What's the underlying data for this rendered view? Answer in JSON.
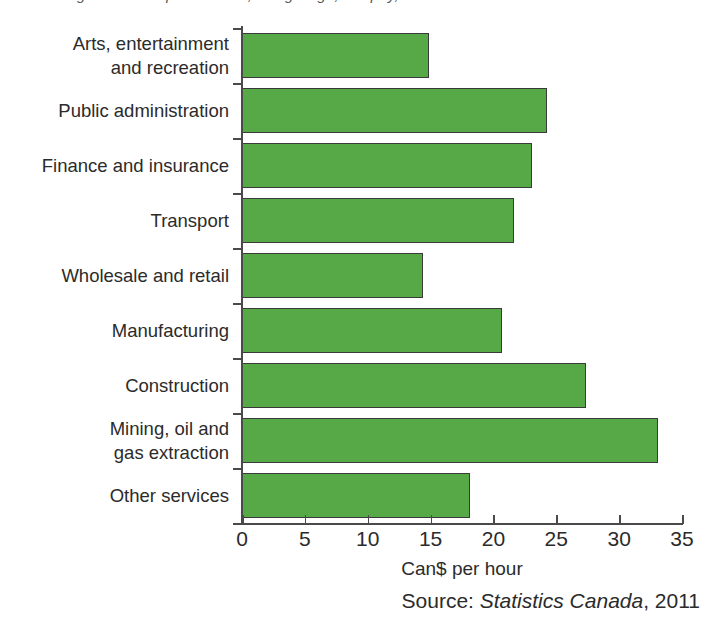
{
  "clipped_title": "degrees of competitiveness, rising wage, low pay,",
  "chart_data": {
    "type": "bar",
    "orientation": "horizontal",
    "title": "",
    "xlabel": "Can$ per hour",
    "ylabel": "",
    "xlim": [
      0,
      35
    ],
    "xticks": [
      0,
      5,
      10,
      15,
      20,
      25,
      30,
      35
    ],
    "grid": false,
    "legend": false,
    "bar_color": "#57a948",
    "bar_edge_color": "#3a3a3a",
    "categories": [
      "Arts, entertainment\nand recreation",
      "Public administration",
      "Finance and insurance",
      "Transport",
      "Wholesale and retail",
      "Manufacturing",
      "Construction",
      "Mining, oil and\ngas extraction",
      "Other services"
    ],
    "values": [
      14.9,
      24.3,
      23.1,
      21.6,
      14.4,
      20.7,
      27.4,
      33.1,
      18.1
    ]
  },
  "source": {
    "prefix": "Source: ",
    "publisher": "Statistics Canada",
    "suffix": ", 2011"
  }
}
